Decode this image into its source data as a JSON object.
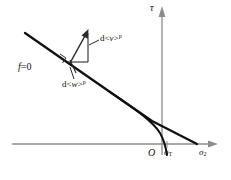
{
  "figure": {
    "background": "#ffffff",
    "width": 231,
    "height": 180
  },
  "colors": {
    "axis": "#8c8c8c",
    "curve": "#101010",
    "annotation": "#2a2a2a",
    "text": "#111111"
  },
  "axes": {
    "vertical": {
      "name": "tau-axis",
      "label": "τ",
      "x": 162,
      "y_top": 8,
      "y_bottom": 155,
      "arrow": "up"
    },
    "horizontal": {
      "name": "sigma2-axis",
      "label": "σ",
      "label_sub": "2",
      "y": 144,
      "x_left": 12,
      "x_right": 218,
      "arrow": "right"
    },
    "origin": {
      "label": "O",
      "x": 162,
      "y": 144
    }
  },
  "labels": {
    "tau": "τ",
    "origin": "O",
    "sigma_T_base": "σ",
    "sigma_T_sub": "T",
    "sigma_2_base": "σ",
    "sigma_2_sub": "2",
    "yield_function": "f",
    "yield_function_value": "=0",
    "d_nu_prefix": "d<",
    "d_nu_symbol": "ν",
    "d_nu_suffix": ">",
    "d_nu_sup": "p",
    "d_w_prefix": "d<",
    "d_w_symbol": "w",
    "d_w_suffix": ">",
    "d_w_sup": "p"
  },
  "curves": {
    "yield_line": {
      "name": "yield-surface-f0",
      "description": "straight yield surface line from upper-left descending to the right",
      "points": [
        [
          25,
          33
        ],
        [
          110,
          92
        ],
        [
          150,
          120
        ],
        [
          197,
          144
        ]
      ]
    },
    "cap_branch": {
      "name": "tension-cap-branch",
      "description": "curved branch bending down to cross axis at sigma-T",
      "points": [
        [
          110,
          92
        ],
        [
          132,
          106
        ],
        [
          148,
          119
        ],
        [
          158,
          131
        ],
        [
          164,
          140
        ],
        [
          166,
          146
        ],
        [
          167,
          153
        ]
      ]
    }
  },
  "flow_construction": {
    "name": "plastic-flow-vector-triangle",
    "tangent_point": [
      71,
      62
    ],
    "vector_tip": [
      88,
      31
    ],
    "vertical_leg": [
      [
        88,
        31
      ],
      [
        88,
        62
      ]
    ],
    "horizontal_leg": [
      [
        68,
        62
      ],
      [
        88,
        62
      ]
    ],
    "right_angle_marker": [
      63,
      56
    ],
    "normal_stub": [
      [
        71,
        62
      ],
      [
        78,
        74
      ]
    ],
    "nu_leader": [
      [
        99,
        40
      ],
      [
        90,
        45
      ]
    ],
    "w_leader": [
      [
        76,
        78
      ],
      [
        72,
        68
      ]
    ]
  }
}
